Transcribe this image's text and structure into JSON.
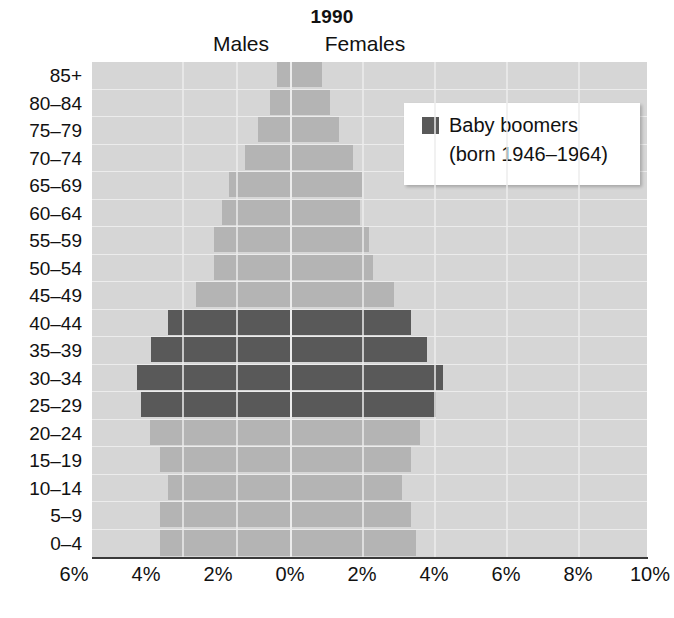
{
  "chart_data": {
    "type": "bar",
    "title": "1990",
    "subtitle_left": "Males",
    "subtitle_right": "Females",
    "xlabel": "",
    "ylabel": "",
    "grid": true,
    "legend_position": "top-right",
    "orientation": "horizontal",
    "chart_style": "population-pyramid",
    "xlim": [
      -6,
      10
    ],
    "xticks": [
      -6,
      -4,
      -2,
      0,
      2,
      4,
      6,
      8,
      10
    ],
    "xtick_labels": [
      "6%",
      "4%",
      "2%",
      "0%",
      "2%",
      "4%",
      "6%",
      "8%",
      "10%"
    ],
    "categories": [
      "85+",
      "80–84",
      "75–79",
      "70–74",
      "65–69",
      "60–64",
      "55–59",
      "50–54",
      "45–49",
      "40–44",
      "35–39",
      "30–34",
      "25–29",
      "20–24",
      "15–19",
      "10–14",
      "5–9",
      "0–4"
    ],
    "series": [
      {
        "name": "Males",
        "side": "left",
        "values": [
          0.35,
          0.55,
          0.9,
          1.25,
          1.7,
          1.9,
          2.1,
          2.1,
          2.6,
          3.4,
          3.85,
          4.25,
          4.15,
          3.9,
          3.6,
          3.4,
          3.6,
          3.6
        ]
      },
      {
        "name": "Females",
        "side": "right",
        "values": [
          0.9,
          1.1,
          1.35,
          1.75,
          2.0,
          1.95,
          2.2,
          2.3,
          2.9,
          3.35,
          3.8,
          4.25,
          4.05,
          3.6,
          3.35,
          3.1,
          3.35,
          3.5
        ]
      }
    ],
    "highlight": {
      "label": "Baby boomers",
      "sublabel": "(born 1946–1964)",
      "categories": [
        "40–44",
        "35–39",
        "30–34",
        "25–29"
      ]
    },
    "colors": {
      "bar": "#b4b4b4",
      "bar_highlight": "#595959",
      "plot_background": "#d6d6d6",
      "gridline": "#ececec",
      "axis_line": "#3a3a3a",
      "legend_background": "#ffffff",
      "text": "#111111"
    }
  },
  "legend": {
    "label": "Baby boomers",
    "sublabel": "(born 1946–1964)"
  }
}
